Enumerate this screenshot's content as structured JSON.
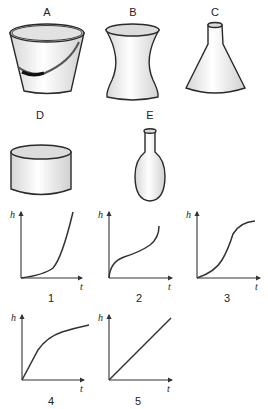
{
  "containers": [
    {
      "id": "A",
      "label": "A",
      "shape": "bucket (truncated cone wider at top, with handle)"
    },
    {
      "id": "B",
      "label": "B",
      "shape": "hourglass / waisted vase"
    },
    {
      "id": "C",
      "label": "C",
      "shape": "conical flask (Erlenmeyer)"
    },
    {
      "id": "D",
      "label": "D",
      "shape": "short wide cylinder"
    },
    {
      "id": "E",
      "label": "E",
      "shape": "round-bottom flask with narrow neck"
    }
  ],
  "graphs": [
    {
      "id": "1",
      "label": "1",
      "y_axis": "h",
      "x_axis": "t",
      "shape": "slow then fast increasing (concave up)"
    },
    {
      "id": "2",
      "label": "2",
      "y_axis": "h",
      "x_axis": "t",
      "shape": "fast, slow, then fast (inflection, concave down then up)"
    },
    {
      "id": "3",
      "label": "3",
      "y_axis": "h",
      "x_axis": "t",
      "shape": "slow, fast, then slow (S-curve)"
    },
    {
      "id": "4",
      "label": "4",
      "y_axis": "h",
      "x_axis": "t",
      "shape": "fast then slow (concave down)"
    },
    {
      "id": "5",
      "label": "5",
      "y_axis": "h",
      "x_axis": "t",
      "shape": "straight line (constant rate)"
    }
  ],
  "axis_labels": {
    "y": "h",
    "x": "t"
  }
}
